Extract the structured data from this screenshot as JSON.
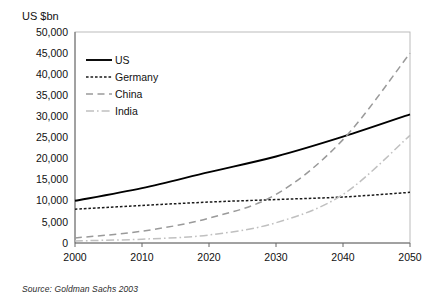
{
  "figure": {
    "yaxis_title": "US $bn",
    "source": "Source:  Goldman Sachs 2003"
  },
  "chart_data": {
    "type": "line",
    "title": "",
    "subtitle": "",
    "xlabel": "",
    "ylabel": "US $bn",
    "xlim": [
      2000,
      2050
    ],
    "ylim": [
      0,
      50000
    ],
    "grid": false,
    "legend_position": "inside-top-left",
    "x": [
      2000,
      2010,
      2020,
      2030,
      2040,
      2050
    ],
    "xticklabels": [
      "2000",
      "2010",
      "2020",
      "2030",
      "2040",
      "2050"
    ],
    "yticks": [
      0,
      5000,
      10000,
      15000,
      20000,
      25000,
      30000,
      35000,
      40000,
      45000,
      50000
    ],
    "yticklabels": [
      "0",
      "5,000",
      "10,000",
      "15,000",
      "20,000",
      "25,000",
      "30,000",
      "35,000",
      "40,000",
      "45,000",
      "50,000"
    ],
    "series": [
      {
        "name": "US",
        "color": "#000000",
        "dash": "solid",
        "values": [
          10000,
          13000,
          16800,
          20500,
          25200,
          30500
        ]
      },
      {
        "name": "Germany",
        "color": "#1a1a1a",
        "dash": "fine-dash",
        "values": [
          8000,
          8900,
          9700,
          10300,
          10900,
          12000
        ]
      },
      {
        "name": "China",
        "color": "#9a9a9a",
        "dash": "long-dash",
        "values": [
          1200,
          2800,
          5900,
          11500,
          24500,
          45000
        ]
      },
      {
        "name": "India",
        "color": "#c0c0c0",
        "dash": "dash-dot",
        "values": [
          500,
          900,
          1900,
          4800,
          11500,
          25500
        ]
      }
    ]
  }
}
